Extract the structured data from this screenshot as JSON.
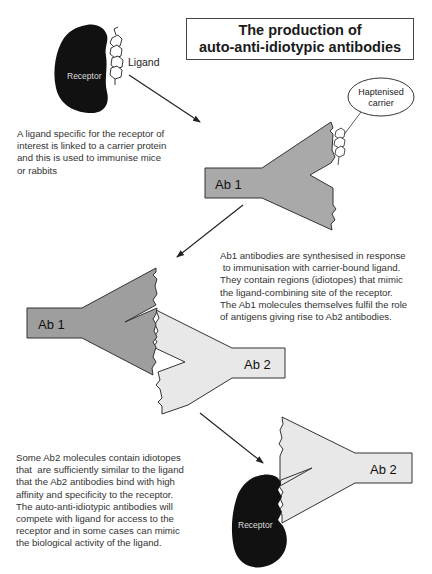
{
  "title": {
    "line1": "The production of",
    "line2": "auto-anti-idiotypic antibodies"
  },
  "labels": {
    "receptor_top": "Receptor",
    "ligand": "Ligand",
    "haptenised_line1": "Haptenised",
    "haptenised_line2": "carrier",
    "ab1_top": "Ab 1",
    "ab1_middle": "Ab 1",
    "ab2_middle": "Ab 2",
    "ab2_bottom": "Ab 2",
    "receptor_bottom": "Receptor"
  },
  "paragraphs": {
    "step1": "A ligand specific for the receptor of\ninterest is linked to a carrier protein\nand this is used to immunise mice\nor rabbits",
    "step2": "Ab1 antibodies are synthesised in response\n to immunisation with carrier-bound ligand.\nThey contain regions (idiotopes) that mimic\nthe ligand-combining site of the receptor.\nThe Ab1 molecules themselves fulfil the role\nof antigens giving rise to Ab2 antibodies.",
    "step3": "Some Ab2 molecules contain idiotopes\nthat  are sufficiently similar to the ligand\nthat the Ab2 antibodies bind with high\naffinity and specificity to the receptor.\nThe auto-anti-idiotypic antibodies will\ncompete with ligand for access to the\nreceptor and in some cases can mimic\nthe biological activity of the ligand."
  },
  "colors": {
    "receptor": "#111111",
    "ab1_fill": "#a9a9a9",
    "ab2_fill": "#e8e8e8",
    "outline": "#333333"
  }
}
